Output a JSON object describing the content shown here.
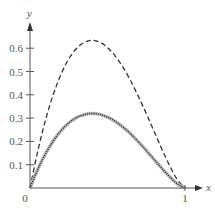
{
  "chart_data": {
    "type": "line",
    "title": "",
    "xlabel": "x",
    "ylabel": "y",
    "xlim": [
      0,
      1
    ],
    "ylim": [
      0,
      0.7
    ],
    "grid": false,
    "legend": null,
    "x_ticks": [
      {
        "value": 0,
        "label": "0"
      },
      {
        "value": 1,
        "label": "1"
      }
    ],
    "y_ticks": [
      {
        "value": 0.1,
        "label": "0.1"
      },
      {
        "value": 0.2,
        "label": "0.2"
      },
      {
        "value": 0.3,
        "label": "0.3"
      },
      {
        "value": 0.4,
        "label": "0.4"
      },
      {
        "value": 0.5,
        "label": "0.5"
      },
      {
        "value": 0.6,
        "label": "0.6"
      }
    ],
    "x": [
      0,
      0.05,
      0.1,
      0.15,
      0.2,
      0.25,
      0.3,
      0.35,
      0.4,
      0.45,
      0.5,
      0.55,
      0.6,
      0.65,
      0.7,
      0.75,
      0.8,
      0.85,
      0.9,
      0.95,
      1
    ],
    "series": [
      {
        "name": "upper-dashed-curve",
        "style": "dashed",
        "color": "#333333",
        "values": [
          0,
          0.158,
          0.291,
          0.401,
          0.488,
          0.554,
          0.599,
          0.625,
          0.634,
          0.626,
          0.603,
          0.566,
          0.518,
          0.459,
          0.392,
          0.32,
          0.244,
          0.168,
          0.097,
          0.036,
          0
        ]
      },
      {
        "name": "lower-solid-gray-curve",
        "style": "solid",
        "color": "#bbbbbb",
        "values": [
          0,
          0.08,
          0.147,
          0.202,
          0.246,
          0.279,
          0.302,
          0.315,
          0.32,
          0.316,
          0.304,
          0.286,
          0.261,
          0.232,
          0.198,
          0.161,
          0.123,
          0.085,
          0.049,
          0.018,
          0
        ]
      },
      {
        "name": "lower-dotted-curve",
        "style": "dotted",
        "color": "#222222",
        "values": [
          0,
          0.08,
          0.147,
          0.202,
          0.246,
          0.279,
          0.302,
          0.315,
          0.32,
          0.316,
          0.304,
          0.286,
          0.261,
          0.232,
          0.198,
          0.161,
          0.123,
          0.085,
          0.049,
          0.018,
          0
        ]
      }
    ]
  }
}
